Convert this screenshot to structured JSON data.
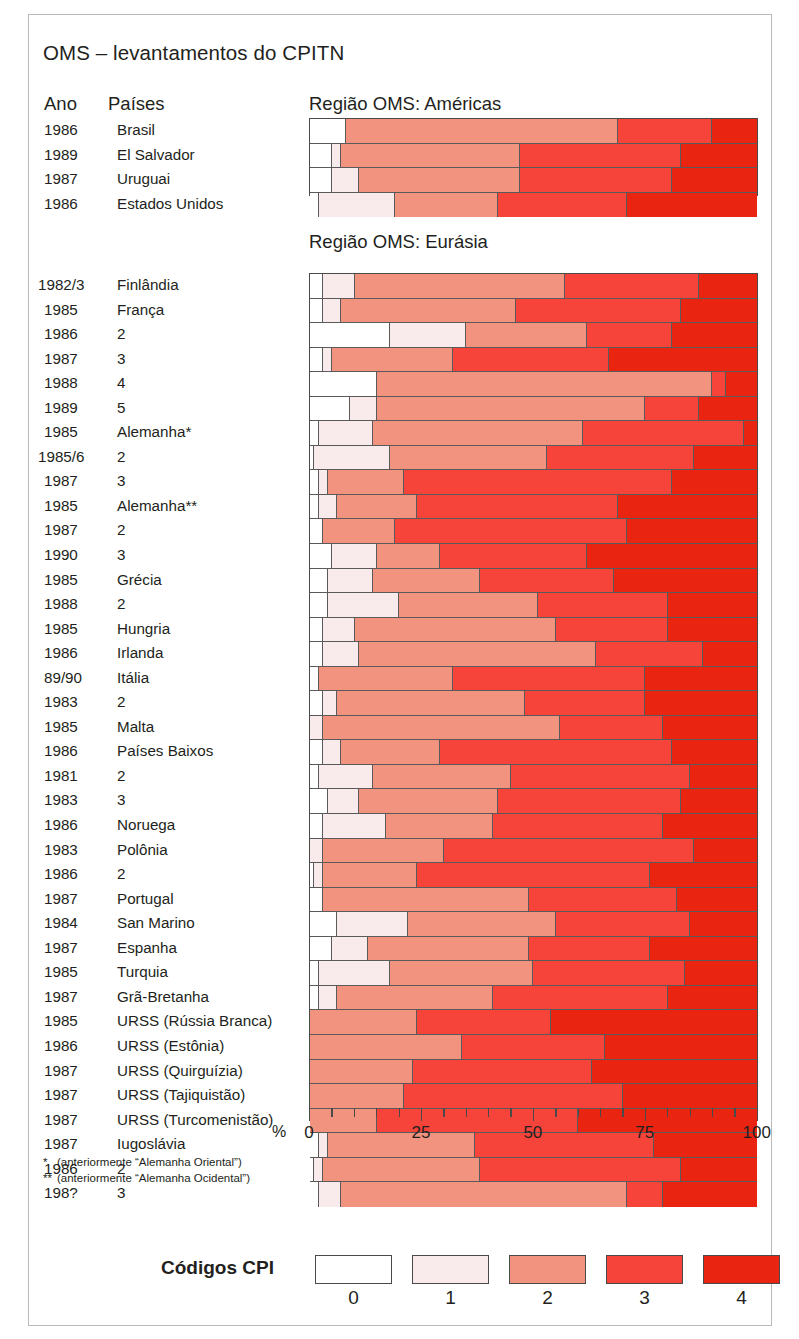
{
  "title": "OMS – levantamentos do CPITN",
  "columns": {
    "year": "Ano",
    "country": "Países"
  },
  "regions": {
    "americas": "Região OMS: Américas",
    "eurasia": "Região OMS: Eurásia"
  },
  "axis": {
    "unit": "%",
    "ticks": [
      0,
      25,
      50,
      75,
      100
    ],
    "tick_labels": [
      "0",
      "25",
      "50",
      "75",
      "100"
    ],
    "minor_step": 5,
    "min": 0,
    "max": 100
  },
  "footnotes": [
    {
      "star": "*",
      "text": "(anteriormente “Alemanha Oriental”)"
    },
    {
      "star": "**",
      "text": "(anteriormente “Alemanha Ocidental”)"
    }
  ],
  "legend": {
    "title": "Códigos CPI",
    "keys": [
      "0",
      "1",
      "2",
      "3",
      "4"
    ],
    "colors": [
      "#ffffff",
      "#f9ebeb",
      "#f2937f",
      "#f6443a",
      "#e92512"
    ]
  },
  "chart_data": {
    "type": "bar",
    "orientation": "horizontal",
    "stacked": true,
    "normalized_percent": true,
    "title": "OMS – levantamentos do CPITN",
    "xlabel": "%",
    "ylabel": "",
    "xlim": [
      0,
      100
    ],
    "grid": false,
    "legend_position": "bottom",
    "series": [
      {
        "name": "0",
        "color": "#ffffff"
      },
      {
        "name": "1",
        "color": "#f9ebeb"
      },
      {
        "name": "2",
        "color": "#f2937f"
      },
      {
        "name": "3",
        "color": "#f6443a"
      },
      {
        "name": "4",
        "color": "#e92512"
      }
    ],
    "groups": [
      {
        "region": "Região OMS: Américas",
        "rows": [
          {
            "year": "1986",
            "country": "Brasil",
            "values": [
              8,
              0,
              61,
              21,
              10
            ]
          },
          {
            "year": "1989",
            "country": "El Salvador",
            "values": [
              5,
              2,
              40,
              36,
              17
            ]
          },
          {
            "year": "1987",
            "country": "Uruguai",
            "values": [
              5,
              6,
              36,
              34,
              19
            ]
          },
          {
            "year": "1986",
            "country": "Estados Unidos",
            "values": [
              2,
              17,
              23,
              29,
              29
            ]
          }
        ]
      },
      {
        "region": "Região OMS: Eurásia",
        "rows": [
          {
            "year": "1982/3",
            "country": "Finlândia",
            "values": [
              3,
              7,
              47,
              30,
              13
            ]
          },
          {
            "year": "1985",
            "country": "França",
            "values": [
              3,
              4,
              39,
              37,
              17
            ]
          },
          {
            "year": "1986",
            "country": "2",
            "values": [
              18,
              17,
              27,
              19,
              19
            ]
          },
          {
            "year": "1987",
            "country": "3",
            "values": [
              3,
              2,
              27,
              35,
              33
            ]
          },
          {
            "year": "1988",
            "country": "4",
            "values": [
              15,
              0,
              75,
              3,
              7
            ]
          },
          {
            "year": "1989",
            "country": "5",
            "values": [
              9,
              6,
              60,
              12,
              13
            ]
          },
          {
            "year": "1985",
            "country": "Alemanha*",
            "values": [
              2,
              12,
              47,
              36,
              3
            ]
          },
          {
            "year": "1985/6",
            "country": "2",
            "values": [
              1,
              17,
              35,
              33,
              14
            ]
          },
          {
            "year": "1987",
            "country": "3",
            "values": [
              2,
              2,
              17,
              60,
              19
            ]
          },
          {
            "year": "1985",
            "country": "Alemanha**",
            "values": [
              2,
              4,
              18,
              45,
              31
            ]
          },
          {
            "year": "1987",
            "country": "2",
            "values": [
              3,
              0,
              16,
              52,
              29
            ]
          },
          {
            "year": "1990",
            "country": "3",
            "values": [
              5,
              10,
              14,
              33,
              38
            ]
          },
          {
            "year": "1985",
            "country": "Grécia",
            "values": [
              4,
              10,
              24,
              30,
              32
            ]
          },
          {
            "year": "1988",
            "country": "2",
            "values": [
              4,
              16,
              31,
              29,
              20
            ]
          },
          {
            "year": "1985",
            "country": "Hungria",
            "values": [
              3,
              7,
              45,
              25,
              20
            ]
          },
          {
            "year": "1986",
            "country": "Irlanda",
            "values": [
              3,
              8,
              53,
              24,
              12
            ]
          },
          {
            "year": "89/90",
            "country": "Itália",
            "values": [
              2,
              0,
              30,
              43,
              25
            ]
          },
          {
            "year": "1983",
            "country": "2",
            "values": [
              3,
              3,
              42,
              27,
              25
            ]
          },
          {
            "year": "1985",
            "country": "Malta",
            "values": [
              0,
              3,
              53,
              23,
              21
            ]
          },
          {
            "year": "1986",
            "country": "Países Baixos",
            "values": [
              3,
              4,
              22,
              52,
              19
            ]
          },
          {
            "year": "1981",
            "country": "2",
            "values": [
              2,
              12,
              31,
              40,
              15
            ]
          },
          {
            "year": "1983",
            "country": "3",
            "values": [
              4,
              7,
              31,
              41,
              17
            ]
          },
          {
            "year": "1986",
            "country": "Noruega",
            "values": [
              3,
              14,
              24,
              38,
              21
            ]
          },
          {
            "year": "1983",
            "country": "Polônia",
            "values": [
              0,
              3,
              27,
              56,
              14
            ]
          },
          {
            "year": "1986",
            "country": "2",
            "values": [
              1,
              2,
              21,
              52,
              24
            ]
          },
          {
            "year": "1987",
            "country": "Portugal",
            "values": [
              3,
              0,
              46,
              33,
              18
            ]
          },
          {
            "year": "1984",
            "country": "San Marino",
            "values": [
              6,
              16,
              33,
              30,
              15
            ]
          },
          {
            "year": "1987",
            "country": "Espanha",
            "values": [
              5,
              8,
              36,
              27,
              24
            ]
          },
          {
            "year": "1985",
            "country": "Turquia",
            "values": [
              2,
              16,
              32,
              34,
              16
            ]
          },
          {
            "year": "1987",
            "country": "Grã-Bretanha",
            "values": [
              2,
              4,
              35,
              39,
              20
            ]
          },
          {
            "year": "1985",
            "country": "URSS (Rússia Branca)",
            "values": [
              0,
              0,
              24,
              30,
              46
            ]
          },
          {
            "year": "1986",
            "country": "URSS (Estônia)",
            "values": [
              0,
              0,
              34,
              32,
              34
            ]
          },
          {
            "year": "1987",
            "country": "URSS (Quirguízia)",
            "values": [
              0,
              0,
              23,
              40,
              37
            ]
          },
          {
            "year": "1987",
            "country": "URSS (Tajiquistão)",
            "values": [
              0,
              0,
              21,
              49,
              30
            ]
          },
          {
            "year": "1987",
            "country": "URSS (Turcomenistão)",
            "values": [
              0,
              0,
              15,
              45,
              40
            ]
          },
          {
            "year": "1987",
            "country": "Iugoslávia",
            "values": [
              2,
              2,
              33,
              40,
              23
            ]
          },
          {
            "year": "1986",
            "country": "2",
            "values": [
              1,
              2,
              35,
              45,
              17
            ]
          },
          {
            "year": "198?",
            "country": "3",
            "values": [
              2,
              5,
              64,
              8,
              21
            ]
          }
        ]
      }
    ]
  }
}
